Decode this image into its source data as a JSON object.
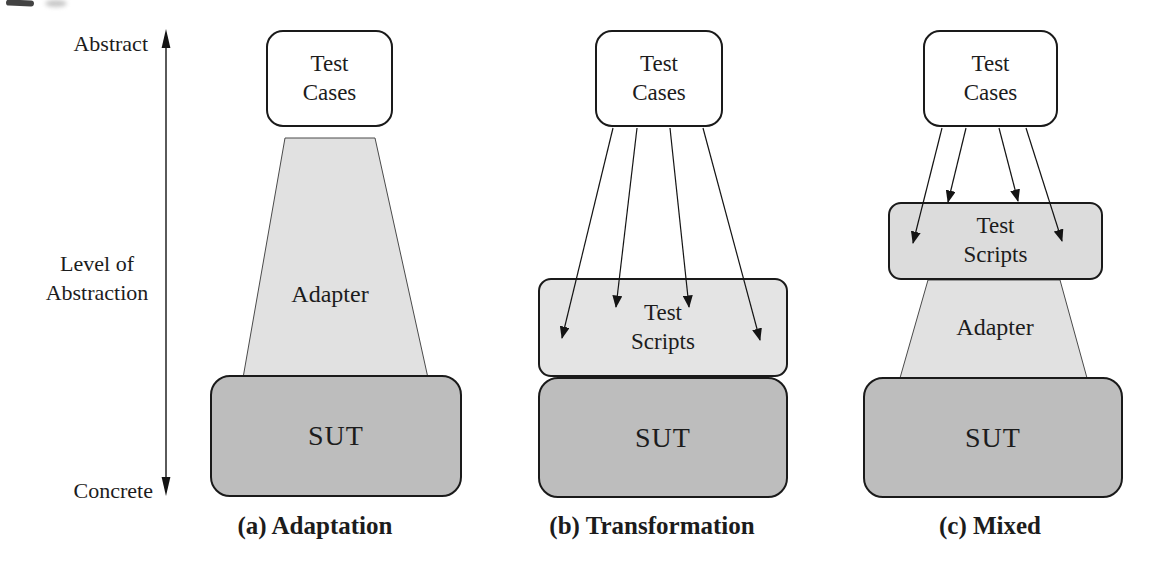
{
  "figure": {
    "axis": {
      "top_label": "Abstract",
      "middle_label": "Level of\nAbstraction",
      "bottom_label": "Concrete"
    },
    "diagrams": [
      {
        "caption": "(a) Adaptation",
        "boxes": {
          "test_cases": "Test\nCases",
          "adapter": "Adapter",
          "sut": "SUT"
        }
      },
      {
        "caption": "(b) Transformation",
        "boxes": {
          "test_cases": "Test\nCases",
          "test_scripts": "Test\nScripts",
          "sut": "SUT"
        }
      },
      {
        "caption": "(c) Mixed",
        "boxes": {
          "test_cases": "Test\nCases",
          "test_scripts": "Test\nScripts",
          "adapter": "Adapter",
          "sut": "SUT"
        }
      }
    ],
    "colors": {
      "background": "#ffffff",
      "box_border": "#1a1a1a",
      "test_cases_fill": "#ffffff",
      "test_scripts_fill_b": "#e4e4e4",
      "test_scripts_fill_c": "#dcdcdc",
      "adapter_fill": "#e1e1e1",
      "sut_fill": "#bdbdbd",
      "arrow_color": "#141414"
    }
  }
}
